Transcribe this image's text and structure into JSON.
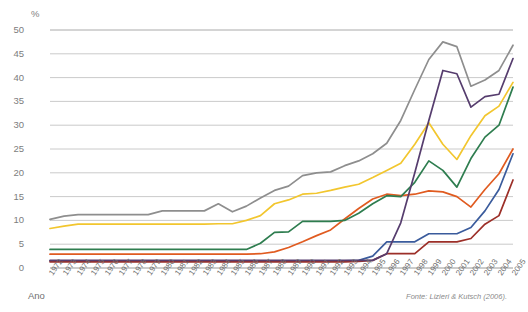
{
  "labels": {
    "y_axis_unit": "%",
    "x_axis_title": "Ano",
    "source": "Fonte: Lizieri & Kutsch (2006)."
  },
  "chart_data": {
    "type": "line",
    "title": "",
    "subtitle": "",
    "xlabel": "Ano",
    "ylabel": "%",
    "ylim": [
      0,
      50
    ],
    "ytick_step": 5,
    "yticks": [
      "0",
      "5",
      "10",
      "15",
      "20",
      "25",
      "30",
      "35",
      "40",
      "45",
      "50"
    ],
    "grid": true,
    "legend": "none",
    "categories": [
      "1972",
      "1973",
      "1974",
      "1975",
      "1976",
      "1977",
      "1978",
      "1979",
      "1980",
      "1981",
      "1982",
      "1983",
      "1984",
      "1985",
      "1986",
      "1987",
      "1988",
      "1989",
      "1990",
      "1991",
      "1992",
      "1993",
      "1994",
      "1995",
      "1996",
      "1997",
      "1998",
      "1999",
      "2000",
      "2001",
      "2002",
      "2003",
      "2004",
      "2005"
    ],
    "series": [
      {
        "name": "series-gray",
        "color": "#8e8e8e",
        "values": [
          10.2,
          10.9,
          11.2,
          11.2,
          11.2,
          11.2,
          11.2,
          11.2,
          12.0,
          12.0,
          12.0,
          12.0,
          13.5,
          11.8,
          13.0,
          14.7,
          16.3,
          17.2,
          19.4,
          20.0,
          20.2,
          21.5,
          22.5,
          24.0,
          26.2,
          31.0,
          37.5,
          43.8,
          47.5,
          46.5,
          38.2,
          39.5,
          41.5,
          46.8
        ]
      },
      {
        "name": "series-purple",
        "color": "#563d6e",
        "values": [
          1.6,
          1.6,
          1.6,
          1.6,
          1.6,
          1.6,
          1.6,
          1.6,
          1.6,
          1.6,
          1.6,
          1.6,
          1.6,
          1.6,
          1.6,
          1.6,
          1.6,
          1.6,
          1.6,
          1.6,
          1.6,
          1.6,
          1.6,
          1.6,
          3.0,
          9.5,
          20.0,
          31.0,
          41.5,
          40.8,
          33.8,
          36.0,
          36.5,
          44.0
        ]
      },
      {
        "name": "series-gold",
        "color": "#f2c62e",
        "values": [
          8.3,
          8.8,
          9.2,
          9.2,
          9.2,
          9.2,
          9.2,
          9.2,
          9.2,
          9.2,
          9.2,
          9.2,
          9.3,
          9.3,
          10.0,
          11.0,
          13.5,
          14.3,
          15.5,
          15.7,
          16.3,
          17.0,
          17.6,
          19.0,
          20.5,
          22.0,
          26.0,
          30.5,
          26.0,
          22.8,
          27.8,
          32.0,
          34.0,
          39.0
        ]
      },
      {
        "name": "series-green",
        "color": "#2e7d4f",
        "values": [
          3.9,
          3.9,
          3.9,
          3.9,
          3.9,
          3.9,
          3.9,
          3.9,
          3.9,
          3.9,
          3.9,
          3.9,
          3.9,
          3.9,
          3.9,
          5.2,
          7.5,
          7.6,
          9.8,
          9.8,
          9.8,
          10.0,
          11.5,
          13.5,
          15.2,
          15.0,
          18.0,
          22.5,
          20.5,
          17.0,
          23.0,
          27.5,
          30.0,
          38.0
        ]
      },
      {
        "name": "series-orange",
        "color": "#e05b20",
        "values": [
          2.9,
          2.9,
          2.9,
          2.9,
          2.9,
          2.9,
          2.9,
          2.9,
          2.9,
          2.9,
          2.9,
          2.9,
          2.9,
          2.9,
          2.9,
          3.0,
          3.4,
          4.3,
          5.5,
          6.8,
          8.0,
          10.3,
          12.5,
          14.5,
          15.5,
          15.2,
          15.5,
          16.2,
          16.0,
          15.0,
          12.8,
          16.5,
          19.8,
          25.0
        ]
      },
      {
        "name": "series-blue",
        "color": "#3a5b9c",
        "values": [
          1.5,
          1.5,
          1.5,
          1.5,
          1.5,
          1.5,
          1.5,
          1.5,
          1.5,
          1.5,
          1.5,
          1.5,
          1.5,
          1.5,
          1.5,
          1.5,
          1.5,
          1.5,
          1.5,
          1.5,
          1.5,
          1.5,
          1.6,
          2.5,
          5.5,
          5.5,
          5.5,
          7.2,
          7.2,
          7.2,
          8.5,
          12.0,
          16.5,
          24.0
        ]
      },
      {
        "name": "series-darkred",
        "color": "#9c2f28",
        "values": [
          1.3,
          1.3,
          1.3,
          1.3,
          1.3,
          1.3,
          1.3,
          1.3,
          1.3,
          1.3,
          1.3,
          1.3,
          1.3,
          1.3,
          1.3,
          1.3,
          1.3,
          1.3,
          1.3,
          1.3,
          1.3,
          1.3,
          1.4,
          1.6,
          3.0,
          3.0,
          3.0,
          5.5,
          5.5,
          5.5,
          6.2,
          9.2,
          11.0,
          18.5
        ]
      }
    ]
  }
}
